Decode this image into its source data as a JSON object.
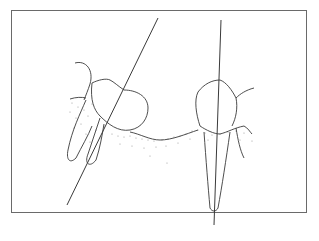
{
  "figure": {
    "type": "dental line illustration",
    "colors": {
      "line": "#3a3a3a",
      "frame": "#6a6a6a",
      "stipple": "#9a9a9a",
      "background": "#ffffff"
    }
  }
}
